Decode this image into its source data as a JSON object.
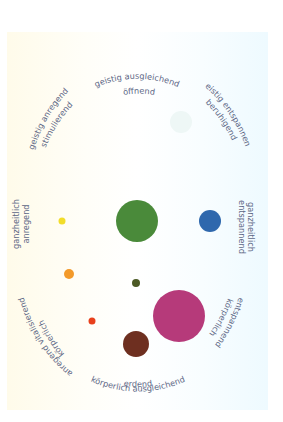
{
  "diagram": {
    "labels": {
      "top_line1": "geistig ausgleichend",
      "top_line2": "öffnend",
      "top_right_line1": "geistig entspannend",
      "top_right_line2": "beruhigend",
      "right_line1": "ganzheitlich",
      "right_line2": "entspannend",
      "bottom_right_line1": "körperlich",
      "bottom_right_line2": "entspannend",
      "bottom_line1": "erdend",
      "bottom_line2": "körperlich ausgleichend",
      "bottom_left_line1": "körperlich",
      "bottom_left_line2": "anregend vitalisierend",
      "left_line1": "ganzheitlich",
      "left_line2": "anregend",
      "top_left_line1": "geistig anregend",
      "top_left_line2": "stimulierend"
    },
    "circles": [
      {
        "name": "pale-teal",
        "cx": 181,
        "cy": 122,
        "r": 11,
        "color": "#eef7f6"
      },
      {
        "name": "green",
        "cx": 137,
        "cy": 221,
        "r": 21,
        "color": "#4a8a3a"
      },
      {
        "name": "blue",
        "cx": 210,
        "cy": 221,
        "r": 11,
        "color": "#2f68ad"
      },
      {
        "name": "yellow",
        "cx": 62,
        "cy": 221,
        "r": 3.5,
        "color": "#f2dd2a"
      },
      {
        "name": "orange",
        "cx": 69,
        "cy": 274,
        "r": 5,
        "color": "#f39a2a"
      },
      {
        "name": "olive",
        "cx": 136,
        "cy": 283,
        "r": 4,
        "color": "#4c5a25"
      },
      {
        "name": "red",
        "cx": 92,
        "cy": 321,
        "r": 3.5,
        "color": "#e8401c"
      },
      {
        "name": "magenta",
        "cx": 179,
        "cy": 316,
        "r": 26,
        "color": "#b63a7a"
      },
      {
        "name": "brown",
        "cx": 136,
        "cy": 344,
        "r": 13,
        "color": "#6e2f20"
      }
    ],
    "colors": {
      "label_text": "#5d6785"
    }
  }
}
